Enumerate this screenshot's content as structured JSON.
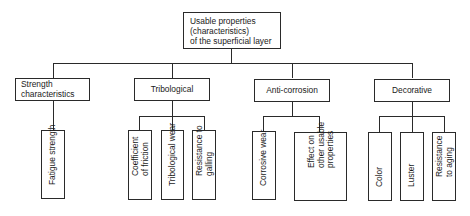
{
  "diagram": {
    "root": {
      "label_lines": [
        "Usable properties",
        "(characteristics)",
        "of the superficial layer"
      ]
    },
    "categories": [
      {
        "label_lines": [
          "Strength",
          "characteristics"
        ],
        "children": [
          {
            "label_lines": [
              "Fatigue strength"
            ]
          }
        ]
      },
      {
        "label_lines": [
          "Tribological"
        ],
        "children": [
          {
            "label_lines": [
              "Coefficient",
              "of friction"
            ]
          },
          {
            "label_lines": [
              "Tribological wear"
            ]
          },
          {
            "label_lines": [
              "Resistance to",
              "galling"
            ]
          }
        ]
      },
      {
        "label_lines": [
          "Anti-corrosion"
        ],
        "children": [
          {
            "label_lines": [
              "Corrosive wear"
            ]
          },
          {
            "label_lines": [
              "Effect on",
              "other usable",
              "properties"
            ]
          }
        ]
      },
      {
        "label_lines": [
          "Decorative"
        ],
        "children": [
          {
            "label_lines": [
              "Color"
            ]
          },
          {
            "label_lines": [
              "Luster"
            ]
          },
          {
            "label_lines": [
              "Resistance",
              "to aging"
            ]
          }
        ]
      }
    ]
  }
}
